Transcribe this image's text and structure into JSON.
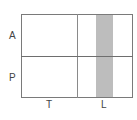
{
  "diagram": {
    "rows": [
      {
        "label": "A"
      },
      {
        "label": "P"
      }
    ],
    "columns": [
      {
        "label": "T"
      },
      {
        "label": "L"
      }
    ],
    "highlight": {
      "column": "L",
      "color": "#bdbdbd"
    },
    "colors": {
      "border": "#7a7a7a",
      "background": "#ffffff",
      "text": "#444444"
    }
  }
}
